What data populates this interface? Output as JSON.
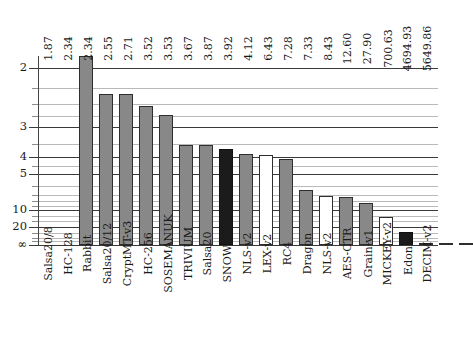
{
  "chart_data": {
    "type": "bar",
    "title": "",
    "subtitle": "",
    "xlabel": "",
    "ylabel": "",
    "scale": "reciprocal",
    "grid": true,
    "legend": null,
    "y_axis": {
      "major_ticks": [
        "2",
        "3",
        "4",
        "5",
        "10",
        "20",
        "∞"
      ],
      "major_values": [
        2,
        3,
        4,
        5,
        10,
        20,
        0
      ],
      "minor_values": [
        2.25,
        2.5,
        2.75,
        3.5,
        4.5,
        6,
        7,
        8,
        9,
        12,
        15,
        30,
        50,
        100
      ],
      "top_value": 1.87,
      "bottom_label": "∞"
    },
    "categories": [
      "Salsa20/8",
      "HC-128",
      "Rabbit",
      "Salsa20/12",
      "CryptMT-v3",
      "HC-256",
      "SOSEMANUK",
      "TRIVIUM",
      "Salsa20",
      "SNOW-2.0",
      "NLS-v2",
      "LEX-v2",
      "RC4",
      "Dragon",
      "NLS-v2",
      "AES-CTR",
      "Grain-v1",
      "MICKEY-v2",
      "Edon80",
      "DECIM-v2"
    ],
    "values": [
      1.87,
      2.34,
      2.34,
      2.55,
      2.71,
      3.52,
      3.53,
      3.67,
      3.87,
      3.92,
      4.12,
      6.43,
      7.28,
      7.33,
      8.43,
      12.6,
      27.9,
      700.63,
      4694.93,
      5649.86
    ],
    "value_labels": [
      "1.87",
      "2.34",
      "2.34",
      "2.55",
      "2.71",
      "3.52",
      "3.53",
      "3.67",
      "3.87",
      "3.92",
      "4.12",
      "6.43",
      "7.28",
      "7.33",
      "8.43",
      "12.60",
      "27.90",
      "700.63",
      "4694.93",
      "5649.86"
    ],
    "bar_styles": [
      "gray",
      "gray",
      "gray",
      "gray",
      "gray",
      "gray",
      "gray",
      "black",
      "gray",
      "white",
      "gray",
      "gray",
      "white",
      "gray",
      "gray",
      "white",
      "black",
      "gray",
      "gray",
      "gray"
    ],
    "colors": {
      "gray": "#888888",
      "black": "#1b1b1b",
      "white": "#ffffff",
      "outline": "#2e2e2e",
      "gridline_major": "#3a3a3a",
      "gridline_minor": "#b9b9b9"
    }
  }
}
